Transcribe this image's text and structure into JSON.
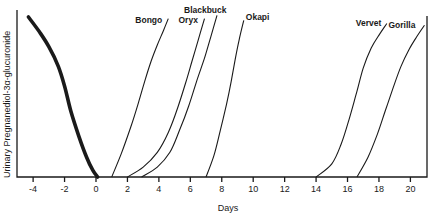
{
  "chart_data": {
    "type": "line",
    "title": "",
    "xlabel": "Days",
    "ylabel": "Urinary Pregnanediol-3α-glucuronide",
    "xlim": [
      -5.1,
      21.2
    ],
    "ylim": [
      0,
      100
    ],
    "x_ticks": [
      -4,
      -2,
      0,
      2,
      4,
      6,
      8,
      10,
      12,
      14,
      16,
      18,
      20
    ],
    "x_tick_labels": [
      "-4",
      "-2",
      "0",
      "2",
      "4",
      "6",
      "8",
      "10",
      "12",
      "14",
      "16",
      "18",
      "20"
    ],
    "y_ticks": [],
    "grid": false,
    "legend": "none (series labelled directly at curve tops)",
    "series": [
      {
        "name": "Decline",
        "label": "",
        "style": "thick",
        "points": [
          [
            -4.3,
            97
          ],
          [
            -3.6,
            88
          ],
          [
            -3.0,
            79
          ],
          [
            -2.4,
            67
          ],
          [
            -2.0,
            55
          ],
          [
            -1.6,
            40
          ],
          [
            -1.1,
            25
          ],
          [
            -0.6,
            12
          ],
          [
            -0.2,
            4
          ],
          [
            0.1,
            0
          ]
        ]
      },
      {
        "name": "Bongo",
        "label": "Bongo",
        "style": "thin",
        "points": [
          [
            1.0,
            0
          ],
          [
            1.6,
            14
          ],
          [
            2.2,
            30
          ],
          [
            2.7,
            45
          ],
          [
            3.1,
            58
          ],
          [
            3.5,
            70
          ],
          [
            3.9,
            80
          ],
          [
            4.3,
            89
          ],
          [
            4.6,
            96
          ]
        ]
      },
      {
        "name": "Oryx",
        "label": "Oryx",
        "style": "thin",
        "points": [
          [
            2.0,
            0
          ],
          [
            3.0,
            6
          ],
          [
            3.9,
            15
          ],
          [
            4.6,
            27
          ],
          [
            5.2,
            42
          ],
          [
            5.7,
            57
          ],
          [
            6.1,
            70
          ],
          [
            6.5,
            83
          ],
          [
            6.9,
            96
          ]
        ]
      },
      {
        "name": "Blackbuck",
        "label": "Blackbuck",
        "style": "thin",
        "points": [
          [
            2.9,
            0
          ],
          [
            3.9,
            6
          ],
          [
            4.7,
            15
          ],
          [
            5.3,
            28
          ],
          [
            5.9,
            43
          ],
          [
            6.4,
            58
          ],
          [
            6.9,
            72
          ],
          [
            7.3,
            85
          ],
          [
            7.7,
            98
          ]
        ]
      },
      {
        "name": "Okapi",
        "label": "Okapi",
        "style": "thin",
        "points": [
          [
            7.0,
            0
          ],
          [
            7.5,
            13
          ],
          [
            7.9,
            28
          ],
          [
            8.3,
            44
          ],
          [
            8.6,
            58
          ],
          [
            8.85,
            71
          ],
          [
            9.1,
            83
          ],
          [
            9.4,
            95
          ]
        ]
      },
      {
        "name": "Vervet",
        "label": "Vervet",
        "style": "thin",
        "points": [
          [
            14.0,
            0
          ],
          [
            15.0,
            8
          ],
          [
            15.6,
            20
          ],
          [
            16.1,
            35
          ],
          [
            16.6,
            52
          ],
          [
            17.0,
            66
          ],
          [
            17.5,
            78
          ],
          [
            18.0,
            86
          ],
          [
            18.5,
            93
          ]
        ]
      },
      {
        "name": "Gorilla",
        "label": "Gorilla",
        "style": "thin",
        "points": [
          [
            16.6,
            0
          ],
          [
            17.3,
            12
          ],
          [
            17.9,
            26
          ],
          [
            18.4,
            40
          ],
          [
            18.9,
            54
          ],
          [
            19.4,
            67
          ],
          [
            19.9,
            77
          ],
          [
            20.4,
            85
          ],
          [
            20.9,
            92
          ]
        ]
      }
    ]
  }
}
